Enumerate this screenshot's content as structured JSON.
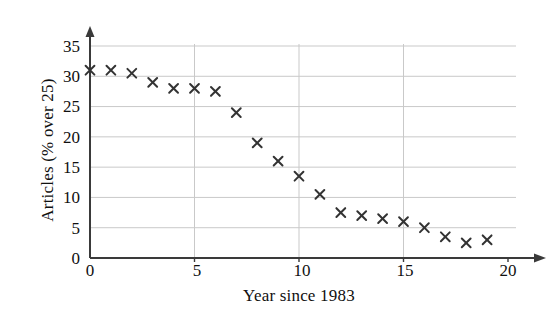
{
  "chart_data": {
    "type": "scatter",
    "title": "",
    "xlabel": "Year since 1983",
    "ylabel": "Articles (% over 25)",
    "xlim": [
      0,
      20
    ],
    "ylim": [
      0,
      35
    ],
    "xticks": [
      0,
      5,
      10,
      15,
      20
    ],
    "yticks": [
      0,
      5,
      10,
      15,
      20,
      25,
      30,
      35
    ],
    "grid": true,
    "legend": null,
    "marker": "x",
    "marker_color": "#333333",
    "x": [
      0,
      1,
      2,
      3,
      4,
      5,
      6,
      7,
      8,
      9,
      10,
      11,
      12,
      13,
      14,
      15,
      16,
      17,
      18,
      19
    ],
    "y": [
      31,
      31,
      30.5,
      29,
      28,
      28,
      27.5,
      24,
      19,
      16,
      13.5,
      10.5,
      7.5,
      7,
      6.5,
      6,
      5,
      3.5,
      2.5,
      3
    ],
    "points": [
      {
        "x": 0,
        "y": 31
      },
      {
        "x": 1,
        "y": 31
      },
      {
        "x": 2,
        "y": 30.5
      },
      {
        "x": 3,
        "y": 29
      },
      {
        "x": 4,
        "y": 28
      },
      {
        "x": 5,
        "y": 28
      },
      {
        "x": 6,
        "y": 27.5
      },
      {
        "x": 7,
        "y": 24
      },
      {
        "x": 8,
        "y": 19
      },
      {
        "x": 9,
        "y": 16
      },
      {
        "x": 10,
        "y": 13.5
      },
      {
        "x": 11,
        "y": 10.5
      },
      {
        "x": 12,
        "y": 7.5
      },
      {
        "x": 13,
        "y": 7
      },
      {
        "x": 14,
        "y": 6.5
      },
      {
        "x": 15,
        "y": 6
      },
      {
        "x": 16,
        "y": 5
      },
      {
        "x": 17,
        "y": 3.5
      },
      {
        "x": 18,
        "y": 2.5
      },
      {
        "x": 19,
        "y": 3
      }
    ]
  },
  "axis_tick_labels": {
    "y": [
      "35",
      "30",
      "25",
      "20",
      "15",
      "10",
      "5",
      "0"
    ],
    "x": [
      "0",
      "5",
      "10",
      "15",
      "20"
    ]
  },
  "style": {
    "grid_color": "#c9c9c9",
    "axis_color": "#3a3a3a",
    "marker_color": "#333333",
    "background": "#ffffff"
  }
}
